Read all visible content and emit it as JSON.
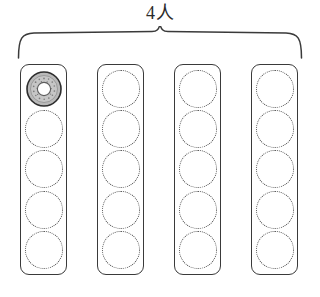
{
  "diagram": {
    "title_label": "4人",
    "brace": {
      "name": "top-brace",
      "span_columns": 4
    },
    "colors": {
      "outline": "#3a3a3a",
      "dotted": "#4a4a4a",
      "donut_fill": "#b8b8b8",
      "donut_ring": "#2d2d2d",
      "donut_hole": "#ffffff",
      "background": "#ffffff"
    },
    "columns": [
      {
        "label": "column-1",
        "slots": [
          {
            "state": "filled",
            "kind": "donut"
          },
          {
            "state": "empty",
            "kind": "dotted-circle"
          },
          {
            "state": "empty",
            "kind": "dotted-circle"
          },
          {
            "state": "empty",
            "kind": "dotted-circle"
          },
          {
            "state": "empty",
            "kind": "dotted-circle"
          }
        ]
      },
      {
        "label": "column-2",
        "slots": [
          {
            "state": "empty",
            "kind": "dotted-circle"
          },
          {
            "state": "empty",
            "kind": "dotted-circle"
          },
          {
            "state": "empty",
            "kind": "dotted-circle"
          },
          {
            "state": "empty",
            "kind": "dotted-circle"
          },
          {
            "state": "empty",
            "kind": "dotted-circle"
          }
        ]
      },
      {
        "label": "column-3",
        "slots": [
          {
            "state": "empty",
            "kind": "dotted-circle"
          },
          {
            "state": "empty",
            "kind": "dotted-circle"
          },
          {
            "state": "empty",
            "kind": "dotted-circle"
          },
          {
            "state": "empty",
            "kind": "dotted-circle"
          },
          {
            "state": "empty",
            "kind": "dotted-circle"
          }
        ]
      },
      {
        "label": "column-4",
        "slots": [
          {
            "state": "empty",
            "kind": "dotted-circle"
          },
          {
            "state": "empty",
            "kind": "dotted-circle"
          },
          {
            "state": "empty",
            "kind": "dotted-circle"
          },
          {
            "state": "empty",
            "kind": "dotted-circle"
          },
          {
            "state": "empty",
            "kind": "dotted-circle"
          }
        ]
      }
    ]
  }
}
